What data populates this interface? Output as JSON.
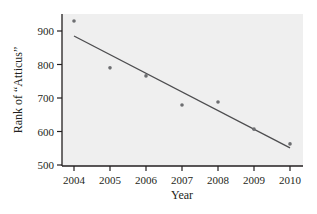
{
  "chart_data": {
    "type": "scatter",
    "title": "",
    "xlabel": "Year",
    "ylabel": "Rank of “Atticus”",
    "x": [
      2004,
      2005,
      2006,
      2007,
      2008,
      2009,
      2010
    ],
    "values": [
      930,
      790,
      766,
      679,
      688,
      607,
      563
    ],
    "series": [
      {
        "name": "Rank of Atticus",
        "x": [
          2004,
          2005,
          2006,
          2007,
          2008,
          2009,
          2010
        ],
        "values": [
          930,
          790,
          766,
          679,
          688,
          607,
          563
        ]
      }
    ],
    "trendline": {
      "x": [
        2004,
        2010
      ],
      "y": [
        885,
        551
      ]
    },
    "xticks": [
      2004,
      2005,
      2006,
      2007,
      2008,
      2009,
      2010
    ],
    "yticks": [
      500,
      600,
      700,
      800,
      900
    ],
    "xlim": [
      2003.67,
      2010.4
    ],
    "ylim": [
      497,
      960
    ],
    "grid": false,
    "legend": null,
    "colors": {
      "plot_bg": "#efefef",
      "point": "#6d6e71",
      "line": "#4d4d4f",
      "axis": "#231f20"
    }
  }
}
